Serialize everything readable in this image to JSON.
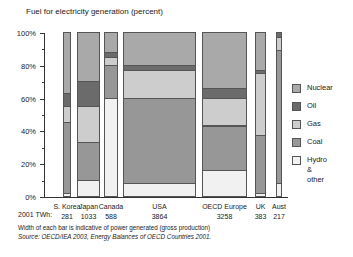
{
  "chart_data": {
    "type": "bar",
    "subtype": "variable-width stacked 100% (marimekko)",
    "title": "Fuel for electricity generation (percent)",
    "xlabel": "",
    "ylabel": "",
    "ylim": [
      0,
      100
    ],
    "yticks": [
      "0%",
      "20%",
      "40%",
      "60%",
      "80%",
      "100%"
    ],
    "grid": false,
    "legend_position": "right",
    "width_label": "2001 TWh:",
    "categories": [
      "S. Korea",
      "Japan",
      "Canada",
      "USA",
      "OECD Europe",
      "UK",
      "Aust"
    ],
    "widths_twh": [
      281,
      1033,
      588,
      3864,
      3258,
      383,
      217
    ],
    "series": [
      {
        "name": "Hydro & other",
        "values": [
          2,
          10,
          60,
          8,
          16,
          2,
          8
        ]
      },
      {
        "name": "Coal",
        "values": [
          43,
          23,
          20,
          52,
          27,
          35,
          81
        ]
      },
      {
        "name": "Gas",
        "values": [
          10,
          22,
          5,
          17,
          17,
          38,
          8
        ]
      },
      {
        "name": "Oil",
        "values": [
          8,
          15,
          3,
          3,
          6,
          2,
          3
        ]
      },
      {
        "name": "Nuclear",
        "values": [
          37,
          30,
          12,
          20,
          34,
          23,
          0
        ]
      }
    ],
    "note": "Width of each bar is indicative of power generated (gross production)",
    "source": "Source: OECD/IEA 2003, Energy Balances of OECD Countries 2001."
  },
  "legend": [
    {
      "key": "nuclear",
      "label": "Nuclear"
    },
    {
      "key": "oil",
      "label": "Oil"
    },
    {
      "key": "gas",
      "label": "Gas"
    },
    {
      "key": "coal",
      "label": "Coal"
    },
    {
      "key": "hydro",
      "label": "Hydro &\nother"
    }
  ]
}
